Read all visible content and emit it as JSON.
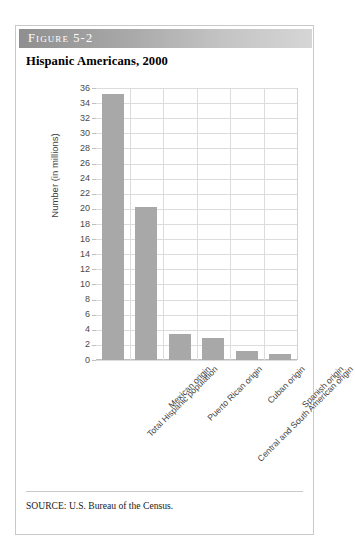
{
  "figure": {
    "header_label": "Figure 5-2",
    "title": "Hispanic Americans, 2000",
    "source_note": "SOURCE: U.S. Bureau of the Census.",
    "border_color": "#c9c9c9",
    "header_gradient_from": "#8f8f8f",
    "header_gradient_to": "#d6d6d6"
  },
  "chart_data": {
    "type": "bar",
    "title": "Hispanic Americans, 2000",
    "xlabel": "",
    "ylabel": "Number (in millions)",
    "ylim": [
      0,
      36
    ],
    "ytick_step": 2,
    "yticks": [
      0,
      2,
      4,
      6,
      8,
      10,
      12,
      14,
      16,
      18,
      20,
      22,
      24,
      26,
      28,
      30,
      32,
      34,
      36
    ],
    "ytick_labels": [
      "0",
      "2",
      "4",
      "6",
      "8",
      "10",
      "12",
      "14",
      "16",
      "18",
      "20",
      "22",
      "24",
      "26",
      "28",
      "30",
      "32",
      "34",
      "36"
    ],
    "categories": [
      "Total Hispanic population",
      "Mexican origin",
      "Puerto Rican origin",
      "Central and South American origin",
      "Cuban origin",
      "Spanish origin"
    ],
    "values": [
      35.2,
      20.3,
      3.4,
      2.9,
      1.2,
      0.8
    ],
    "bar_color": "#a8a8a8",
    "grid": "both",
    "gridline_color": "#dcdcdc",
    "legend": "none",
    "xtick_rotation_deg": -45
  }
}
